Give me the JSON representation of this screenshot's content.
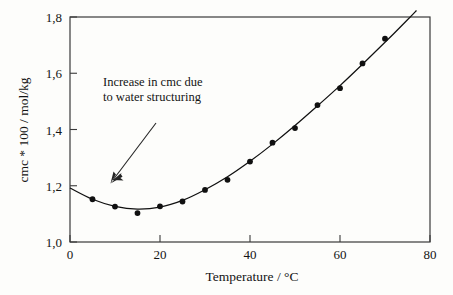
{
  "chart_data": {
    "type": "line",
    "title": "",
    "subtitle": "",
    "xlabel": "Temperature / °C",
    "ylabel": "cmc * 100 / mol/kg",
    "xlim": [
      0,
      80
    ],
    "ylim": [
      1.0,
      1.8
    ],
    "xticks": [
      0,
      20,
      40,
      60,
      80
    ],
    "xtick_labels": [
      "0",
      "20",
      "40",
      "60",
      "80"
    ],
    "yticks": [
      1.0,
      1.2,
      1.4,
      1.6,
      1.8
    ],
    "ytick_labels": [
      "1,0",
      "1,2",
      "1,4",
      "1,6",
      "1,8"
    ],
    "grid": false,
    "legend_position": "none",
    "marker_color": "#101010",
    "line_color": "#101010",
    "frame_color": "#3a3a3a",
    "background_color": "#fdfdfb",
    "series": [
      {
        "name": "cmc data points",
        "marker": "filled-circle",
        "x": [
          5,
          10,
          15,
          20,
          25,
          30,
          35,
          40,
          45,
          50,
          55,
          60,
          65,
          70
        ],
        "y": [
          1.152,
          1.126,
          1.103,
          1.127,
          1.144,
          1.185,
          1.221,
          1.286,
          1.353,
          1.405,
          1.487,
          1.547,
          1.635,
          1.723
        ]
      },
      {
        "name": "fitted curve",
        "marker": "none",
        "x": [
          0,
          5,
          10,
          15,
          20,
          25,
          30,
          35,
          40,
          45,
          50,
          55,
          60,
          65,
          70,
          75,
          77
        ],
        "y": [
          1.192,
          1.152,
          1.127,
          1.117,
          1.124,
          1.148,
          1.186,
          1.232,
          1.287,
          1.348,
          1.414,
          1.484,
          1.556,
          1.632,
          1.71,
          1.79,
          1.823
        ]
      }
    ],
    "annotations": [
      {
        "name": "increase-in-cmc-note",
        "lines": [
          "Increase in cmc due",
          "to water structuring"
        ],
        "arrow_from": [
          12.5,
          1.58
        ],
        "arrow_to": [
          8.2,
          1.365
        ]
      }
    ]
  },
  "annotation": {
    "line1": "Increase in cmc due",
    "line2": "to water structuring"
  },
  "axes": {
    "x_title": "Temperature / °C",
    "y_title": "cmc * 100 / mol/kg",
    "x_labels": [
      "0",
      "20",
      "40",
      "60",
      "80"
    ],
    "y_labels": [
      "1,0",
      "1,2",
      "1,4",
      "1,6",
      "1,8"
    ]
  }
}
